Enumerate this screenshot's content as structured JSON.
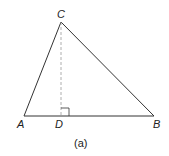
{
  "diagram": {
    "type": "triangle-with-altitude",
    "caption": "(a)",
    "vertices": {
      "A": {
        "label": "A",
        "x": 24,
        "y": 116
      },
      "B": {
        "label": "B",
        "x": 154,
        "y": 116
      },
      "C": {
        "label": "C",
        "x": 61,
        "y": 22
      },
      "D": {
        "label": "D",
        "x": 61,
        "y": 116
      }
    },
    "segments": [
      {
        "from": "A",
        "to": "B",
        "style": "solid"
      },
      {
        "from": "A",
        "to": "C",
        "style": "solid"
      },
      {
        "from": "C",
        "to": "B",
        "style": "solid"
      },
      {
        "from": "C",
        "to": "D",
        "style": "dashed"
      }
    ],
    "right_angle_at": "D",
    "colors": {
      "stroke": "#333333",
      "dashed": "#999999"
    }
  }
}
